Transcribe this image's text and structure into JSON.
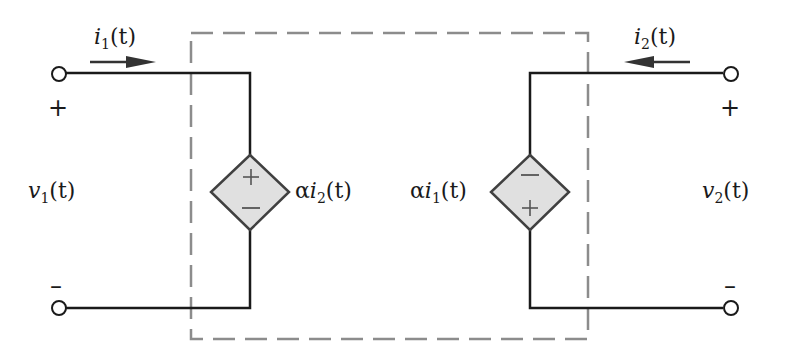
{
  "diagram": {
    "type": "two-port network",
    "colors": {
      "wire": "#1a1a1a",
      "boundary_dashed": "#8c8c8c",
      "source_fill": "#e0e0e0",
      "source_stroke": "#404040",
      "background": "#ffffff"
    },
    "port1": {
      "current_label": {
        "var": "i",
        "sub": "1",
        "arg": "(t)"
      },
      "current_direction": "right",
      "voltage_label": {
        "var": "v",
        "sub": "1",
        "arg": "(t)"
      },
      "plus": "+",
      "minus": "–"
    },
    "port2": {
      "current_label": {
        "var": "i",
        "sub": "2",
        "arg": "(t)"
      },
      "current_direction": "left",
      "voltage_label": {
        "var": "v",
        "sub": "2",
        "arg": "(t)"
      },
      "plus": "+",
      "minus": "–"
    },
    "left_source": {
      "kind": "dependent voltage source",
      "top_sign": "+",
      "bottom_sign": "–",
      "label": {
        "coef": "α",
        "var": "i",
        "sub": "2",
        "arg": "(t)"
      }
    },
    "right_source": {
      "kind": "dependent voltage source",
      "top_sign": "–",
      "bottom_sign": "+",
      "label": {
        "coef": "α",
        "var": "i",
        "sub": "1",
        "arg": "(t)"
      }
    }
  }
}
